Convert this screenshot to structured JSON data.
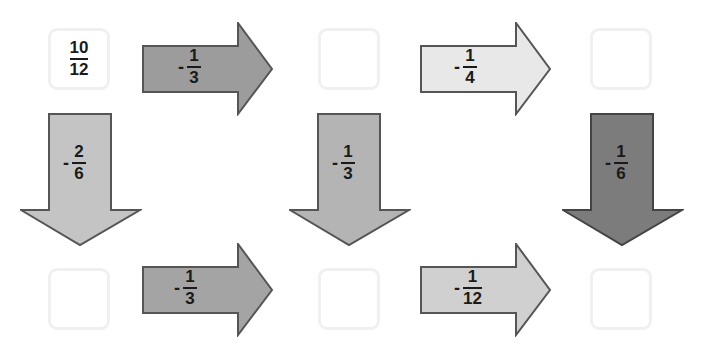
{
  "boxes": [
    {
      "id": "r1c1",
      "value_num": "10",
      "value_den": "12",
      "x": 48,
      "y": 28
    },
    {
      "id": "r1c2",
      "value_num": "",
      "value_den": "",
      "x": 318,
      "y": 28
    },
    {
      "id": "r1c3",
      "value_num": "",
      "value_den": "",
      "x": 590,
      "y": 28
    },
    {
      "id": "r2c1",
      "value_num": "",
      "value_den": "",
      "x": 48,
      "y": 268
    },
    {
      "id": "r2c2",
      "value_num": "",
      "value_den": "",
      "x": 318,
      "y": 268
    },
    {
      "id": "r2c3",
      "value_num": "",
      "value_den": "",
      "x": 590,
      "y": 268
    }
  ],
  "arrows": {
    "top_left": {
      "direction": "right",
      "sign": "-",
      "num": "1",
      "den": "3",
      "color": "#9c9c9c"
    },
    "top_right": {
      "direction": "right",
      "sign": "-",
      "num": "1",
      "den": "4",
      "color": "#e8e8e8"
    },
    "down_left": {
      "direction": "down",
      "sign": "-",
      "num": "2",
      "den": "6",
      "color": "#c4c4c4"
    },
    "down_middle": {
      "direction": "down",
      "sign": "-",
      "num": "1",
      "den": "3",
      "color": "#b4b4b4"
    },
    "down_right": {
      "direction": "down",
      "sign": "-",
      "num": "1",
      "den": "6",
      "color": "#7c7c7c"
    },
    "bottom_left": {
      "direction": "right",
      "sign": "-",
      "num": "1",
      "den": "3",
      "color": "#a4a4a4"
    },
    "bottom_right": {
      "direction": "right",
      "sign": "-",
      "num": "1",
      "den": "12",
      "color": "#d0d0d0"
    }
  }
}
